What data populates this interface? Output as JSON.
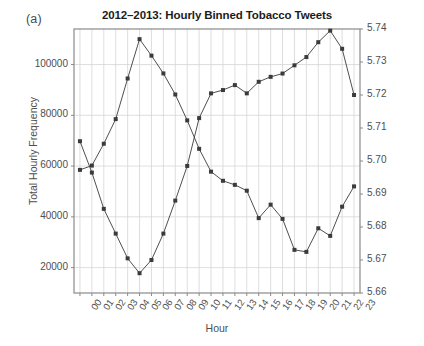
{
  "panel": {
    "label": "(a)"
  },
  "chart_data": {
    "type": "line",
    "title": "2012–2013: Hourly Binned Tobacco Tweets",
    "xlabel": "Hour",
    "ylabel": "Total Hourly Frequency",
    "ylabel_right": "Average Happiness",
    "grid": true,
    "legend": "none",
    "categories": [
      "00",
      "01",
      "02",
      "03",
      "04",
      "05",
      "06",
      "07",
      "08",
      "09",
      "10",
      "11",
      "12",
      "13",
      "14",
      "15",
      "16",
      "17",
      "18",
      "19",
      "20",
      "21",
      "22",
      "23"
    ],
    "x": [
      0,
      1,
      2,
      3,
      4,
      5,
      6,
      7,
      8,
      9,
      10,
      11,
      12,
      13,
      14,
      15,
      16,
      17,
      18,
      19,
      20,
      21,
      22,
      23
    ],
    "ylim": [
      10000,
      114000
    ],
    "yticks": [
      20000,
      40000,
      60000,
      80000,
      100000
    ],
    "ytick_labels": [
      "20000",
      "40000",
      "60000",
      "80000",
      "100000"
    ],
    "ylim_right": [
      5.66,
      5.74
    ],
    "yticks_right": [
      5.66,
      5.67,
      5.68,
      5.69,
      5.7,
      5.71,
      5.72,
      5.73,
      5.74
    ],
    "ytick_labels_right": [
      "5.66",
      "5.67",
      "5.68",
      "5.69",
      "5.70",
      "5.71",
      "5.72",
      "5.73",
      "5.74"
    ],
    "series": [
      {
        "name": "Total Hourly Frequency",
        "axis": "left",
        "color": "#3b3b3b",
        "values": [
          58500,
          60200,
          68800,
          78500,
          94500,
          110000,
          103500,
          96500,
          88200,
          78000,
          66800,
          57800,
          54200,
          52600,
          50300,
          39500,
          44800,
          39200,
          27000,
          26200,
          35500,
          32500,
          44000,
          52000
        ]
      },
      {
        "name": "Average Happiness",
        "axis": "right",
        "color": "#3b3b3b",
        "values": [
          5.706,
          5.6965,
          5.6855,
          5.678,
          5.6705,
          5.666,
          5.67,
          5.678,
          5.688,
          5.6985,
          5.713,
          5.7205,
          5.7215,
          5.723,
          5.7205,
          5.724,
          5.7255,
          5.7265,
          5.729,
          5.7315,
          5.736,
          5.7395,
          5.734,
          5.72
        ]
      }
    ]
  }
}
